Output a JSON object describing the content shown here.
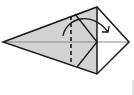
{
  "diagram": {
    "type": "origami-fold-step",
    "colors": {
      "background": "#ffffff",
      "paper_fill": "#d3d3d3",
      "paper_white": "#ffffff",
      "outline": "#1a1a1a",
      "center_crease": "#888888",
      "fold_line": "#1a1a1a",
      "arrow": "#1a1a1a"
    },
    "points": {
      "left_tip": [
        3,
        42
      ],
      "top_vertex": [
        97,
        7
      ],
      "right_vertex": [
        129,
        42
      ],
      "bottom_vertex": [
        97,
        74
      ],
      "flap_top": [
        75,
        14
      ],
      "flap_mid": [
        97,
        42
      ],
      "flap_bottom": [
        77,
        67
      ]
    },
    "fold_line": {
      "style": "dashed",
      "x": 71,
      "y1": 16,
      "y2": 66
    },
    "arrow": {
      "from": [
        63,
        36
      ],
      "to": [
        108,
        32
      ],
      "direction": "fold-right"
    },
    "edge_mark": {
      "x": 133,
      "y1": 80,
      "y2": 95
    }
  }
}
